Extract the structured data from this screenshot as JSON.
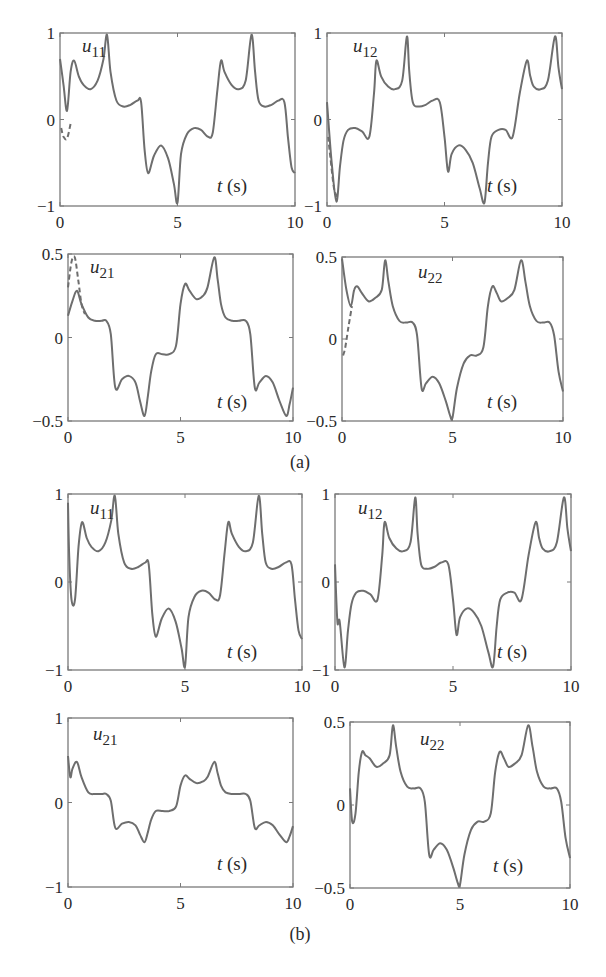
{
  "figure": {
    "captions": [
      "(a)",
      "(b)"
    ],
    "line_color": "#6e6e6e",
    "axis_color": "#7a7a7a",
    "text_color": "#2a2a2a"
  },
  "chart_data": [
    {
      "id": "a-u11",
      "panel": "(a)",
      "type": "line",
      "title": "u11",
      "label_main": "u",
      "label_sub": "11",
      "xlabel": "t (s)",
      "xlim": [
        0,
        10
      ],
      "ylim": [
        -1,
        1
      ],
      "xticks": [
        "0",
        "5",
        "10"
      ],
      "yticks": [
        "-1",
        "0",
        "1"
      ],
      "box": [
        60,
        33,
        295,
        206
      ],
      "series": [
        {
          "name": "actual",
          "style": "solid",
          "x": [
            0,
            0.15,
            0.3,
            0.45,
            0.6,
            0.8,
            1.0,
            1.3,
            1.6,
            1.85,
            2.0,
            2.15,
            2.4,
            2.7,
            3.0,
            3.3,
            3.45,
            3.6,
            3.75,
            4.0,
            4.3,
            4.6,
            4.85,
            5.0,
            5.15,
            5.4,
            5.7,
            6.0,
            6.3,
            6.5,
            6.7,
            6.85,
            7.0,
            7.3,
            7.6,
            7.9,
            8.15,
            8.3,
            8.45,
            8.7,
            9.0,
            9.3,
            9.55,
            9.7,
            9.85,
            10
          ],
          "y": [
            0.7,
            0.4,
            0.1,
            0.55,
            0.68,
            0.5,
            0.4,
            0.35,
            0.45,
            0.7,
            0.98,
            0.55,
            0.22,
            0.15,
            0.17,
            0.22,
            0.2,
            -0.35,
            -0.62,
            -0.42,
            -0.3,
            -0.45,
            -0.75,
            -0.96,
            -0.4,
            -0.17,
            -0.1,
            -0.12,
            -0.2,
            -0.15,
            0.35,
            0.68,
            0.55,
            0.4,
            0.35,
            0.45,
            0.98,
            0.55,
            0.22,
            0.15,
            0.17,
            0.22,
            0.2,
            -0.2,
            -0.55,
            -0.62
          ]
        },
        {
          "name": "reference",
          "style": "dashed",
          "x": [
            0.05,
            0.15,
            0.3,
            0.45
          ],
          "y": [
            -0.1,
            -0.2,
            -0.22,
            -0.05
          ]
        }
      ]
    },
    {
      "id": "a-u12",
      "panel": "(a)",
      "type": "line",
      "title": "u12",
      "label_main": "u",
      "label_sub": "12",
      "xlabel": "t (s)",
      "xlim": [
        0,
        10
      ],
      "ylim": [
        -1,
        1
      ],
      "xticks": [
        "0",
        "5",
        "10"
      ],
      "yticks": [
        "-1",
        "0",
        "1"
      ],
      "box": [
        327,
        33,
        562,
        206
      ],
      "series": [
        {
          "name": "actual",
          "style": "solid",
          "x": [
            0,
            0.2,
            0.4,
            0.55,
            0.7,
            0.9,
            1.2,
            1.5,
            1.8,
            2.0,
            2.1,
            2.3,
            2.6,
            2.9,
            3.2,
            3.4,
            3.5,
            3.65,
            3.9,
            4.2,
            4.5,
            4.8,
            5.0,
            5.15,
            5.3,
            5.6,
            5.9,
            6.2,
            6.5,
            6.7,
            6.85,
            7.0,
            7.3,
            7.6,
            7.9,
            8.2,
            8.5,
            8.65,
            8.8,
            9.1,
            9.4,
            9.7,
            9.85,
            10
          ],
          "y": [
            0.2,
            -0.5,
            -0.95,
            -0.55,
            -0.25,
            -0.12,
            -0.1,
            -0.14,
            -0.2,
            0.3,
            0.68,
            0.5,
            0.38,
            0.35,
            0.45,
            0.96,
            0.55,
            0.2,
            0.15,
            0.17,
            0.22,
            0.2,
            -0.2,
            -0.6,
            -0.4,
            -0.3,
            -0.35,
            -0.5,
            -0.8,
            -0.96,
            -0.5,
            -0.2,
            -0.12,
            -0.12,
            -0.2,
            0.3,
            0.68,
            0.5,
            0.38,
            0.35,
            0.45,
            0.96,
            0.6,
            0.35
          ]
        },
        {
          "name": "reference",
          "style": "dashed",
          "x": [
            0.05,
            0.15,
            0.3,
            0.45
          ],
          "y": [
            -0.2,
            -0.45,
            -0.8,
            -0.9
          ]
        }
      ]
    },
    {
      "id": "a-u21",
      "panel": "(a)",
      "type": "line",
      "title": "u21",
      "label_main": "u",
      "label_sub": "21",
      "xlabel": "t (s)",
      "xlim": [
        0,
        10
      ],
      "ylim": [
        -0.5,
        0.5
      ],
      "xticks": [
        "0",
        "5",
        "10"
      ],
      "yticks": [
        "-0.5",
        "0",
        "0.5"
      ],
      "box": [
        68,
        254,
        293,
        421
      ],
      "series": [
        {
          "name": "actual",
          "style": "solid",
          "x": [
            0,
            0.2,
            0.4,
            0.6,
            0.9,
            1.2,
            1.5,
            1.7,
            1.9,
            2.1,
            2.4,
            2.7,
            3.0,
            3.2,
            3.4,
            3.55,
            3.7,
            3.9,
            4.2,
            4.5,
            4.8,
            5.0,
            5.2,
            5.4,
            5.7,
            6.0,
            6.2,
            6.5,
            6.65,
            6.8,
            7.0,
            7.3,
            7.6,
            7.9,
            8.1,
            8.3,
            8.5,
            8.8,
            9.1,
            9.4,
            9.7,
            9.85,
            10
          ],
          "y": [
            0.13,
            0.22,
            0.28,
            0.2,
            0.12,
            0.1,
            0.1,
            0.1,
            0.02,
            -0.3,
            -0.25,
            -0.23,
            -0.27,
            -0.38,
            -0.47,
            -0.35,
            -0.2,
            -0.1,
            -0.1,
            -0.1,
            -0.05,
            0.2,
            0.32,
            0.28,
            0.23,
            0.25,
            0.3,
            0.48,
            0.35,
            0.2,
            0.12,
            0.1,
            0.1,
            0.1,
            0.02,
            -0.3,
            -0.27,
            -0.23,
            -0.27,
            -0.38,
            -0.47,
            -0.4,
            -0.3
          ]
        },
        {
          "name": "reference",
          "style": "dashed",
          "x": [
            0.0,
            0.15,
            0.3,
            0.45,
            0.6,
            0.75
          ],
          "y": [
            0.3,
            0.45,
            0.48,
            0.35,
            0.2,
            0.14
          ]
        }
      ]
    },
    {
      "id": "a-u22",
      "panel": "(a)",
      "type": "line",
      "title": "u22",
      "label_main": "u",
      "label_sub": "22",
      "xlabel": "t (s)",
      "xlim": [
        0,
        10
      ],
      "ylim": [
        -0.5,
        0.5
      ],
      "xticks": [
        "0",
        "5",
        "10"
      ],
      "yticks": [
        "-0.5",
        "0",
        "0.5"
      ],
      "box": [
        342,
        257,
        563,
        421
      ],
      "series": [
        {
          "name": "actual",
          "style": "solid",
          "x": [
            0,
            0.2,
            0.4,
            0.55,
            0.7,
            0.9,
            1.2,
            1.5,
            1.8,
            1.95,
            2.1,
            2.3,
            2.6,
            2.9,
            3.2,
            3.4,
            3.6,
            3.8,
            4.1,
            4.4,
            4.7,
            4.9,
            5.0,
            5.2,
            5.5,
            5.8,
            6.1,
            6.4,
            6.6,
            6.8,
            7.0,
            7.2,
            7.5,
            7.8,
            8.1,
            8.3,
            8.5,
            8.8,
            9.1,
            9.4,
            9.6,
            9.8,
            10
          ],
          "y": [
            0.49,
            0.3,
            0.2,
            0.3,
            0.32,
            0.28,
            0.23,
            0.25,
            0.3,
            0.48,
            0.35,
            0.2,
            0.11,
            0.1,
            0.1,
            0.02,
            -0.3,
            -0.27,
            -0.23,
            -0.27,
            -0.38,
            -0.47,
            -0.48,
            -0.3,
            -0.15,
            -0.1,
            -0.1,
            -0.05,
            0.2,
            0.32,
            0.28,
            0.23,
            0.25,
            0.3,
            0.48,
            0.35,
            0.2,
            0.11,
            0.1,
            0.1,
            0.02,
            -0.2,
            -0.32
          ]
        },
        {
          "name": "reference",
          "style": "dashed",
          "x": [
            0.05,
            0.15,
            0.3,
            0.45
          ],
          "y": [
            -0.1,
            -0.05,
            0.08,
            0.2
          ]
        }
      ]
    },
    {
      "id": "b-u11",
      "panel": "(b)",
      "type": "line",
      "title": "u11",
      "label_main": "u",
      "label_sub": "11",
      "xlabel": "t (s)",
      "xlim": [
        0,
        10
      ],
      "ylim": [
        -1,
        1
      ],
      "xticks": [
        "0",
        "5",
        "10"
      ],
      "yticks": [
        "-1",
        "0",
        "1"
      ],
      "box": [
        68,
        494,
        302,
        670
      ],
      "series": [
        {
          "name": "actual",
          "style": "solid",
          "x": [
            0,
            0.05,
            0.15,
            0.3,
            0.45,
            0.6,
            0.8,
            1.0,
            1.3,
            1.6,
            1.85,
            2.0,
            2.15,
            2.4,
            2.7,
            3.0,
            3.3,
            3.45,
            3.6,
            3.75,
            4.0,
            4.3,
            4.6,
            4.85,
            5.0,
            5.15,
            5.4,
            5.7,
            6.0,
            6.3,
            6.5,
            6.7,
            6.85,
            7.0,
            7.3,
            7.6,
            7.9,
            8.15,
            8.3,
            8.45,
            8.7,
            9.0,
            9.3,
            9.55,
            9.7,
            9.85,
            10
          ],
          "y": [
            0.9,
            0.3,
            -0.2,
            -0.2,
            0.4,
            0.68,
            0.5,
            0.4,
            0.35,
            0.45,
            0.7,
            0.98,
            0.55,
            0.22,
            0.15,
            0.17,
            0.22,
            0.2,
            -0.35,
            -0.62,
            -0.42,
            -0.3,
            -0.45,
            -0.75,
            -0.96,
            -0.4,
            -0.17,
            -0.1,
            -0.12,
            -0.2,
            -0.15,
            0.35,
            0.68,
            0.55,
            0.4,
            0.35,
            0.45,
            0.98,
            0.55,
            0.22,
            0.15,
            0.17,
            0.22,
            0.2,
            -0.2,
            -0.55,
            -0.65
          ]
        }
      ]
    },
    {
      "id": "b-u12",
      "panel": "(b)",
      "type": "line",
      "title": "u12",
      "label_main": "u",
      "label_sub": "12",
      "xlabel": "t (s)",
      "xlim": [
        0,
        10
      ],
      "ylim": [
        -1,
        1
      ],
      "xticks": [
        "0",
        "5",
        "10"
      ],
      "yticks": [
        "-1",
        "0",
        "1"
      ],
      "box": [
        335,
        494,
        571,
        670
      ],
      "series": [
        {
          "name": "actual",
          "style": "solid",
          "x": [
            0,
            0.1,
            0.2,
            0.4,
            0.55,
            0.7,
            0.9,
            1.2,
            1.5,
            1.8,
            2.0,
            2.1,
            2.3,
            2.6,
            2.9,
            3.2,
            3.4,
            3.5,
            3.65,
            3.9,
            4.2,
            4.5,
            4.8,
            5.0,
            5.15,
            5.3,
            5.6,
            5.9,
            6.2,
            6.5,
            6.7,
            6.85,
            7.0,
            7.3,
            7.6,
            7.9,
            8.2,
            8.5,
            8.65,
            8.8,
            9.1,
            9.4,
            9.7,
            9.85,
            10
          ],
          "y": [
            0.2,
            -0.45,
            -0.45,
            -0.97,
            -0.55,
            -0.25,
            -0.12,
            -0.1,
            -0.14,
            -0.2,
            0.3,
            0.68,
            0.5,
            0.38,
            0.35,
            0.45,
            0.96,
            0.55,
            0.2,
            0.15,
            0.17,
            0.22,
            0.2,
            -0.2,
            -0.6,
            -0.4,
            -0.3,
            -0.35,
            -0.5,
            -0.8,
            -0.96,
            -0.5,
            -0.2,
            -0.12,
            -0.12,
            -0.2,
            0.3,
            0.68,
            0.5,
            0.38,
            0.35,
            0.45,
            0.96,
            0.6,
            0.35
          ]
        }
      ]
    },
    {
      "id": "b-u21",
      "panel": "(b)",
      "type": "line",
      "title": "u21",
      "label_main": "u",
      "label_sub": "21",
      "xlabel": "t (s)",
      "xlim": [
        0,
        10
      ],
      "ylim": [
        -1,
        1
      ],
      "xticks": [
        "0",
        "5",
        "10"
      ],
      "yticks": [
        "-1",
        "0",
        "1"
      ],
      "box": [
        68,
        718,
        293,
        887
      ],
      "series": [
        {
          "name": "actual",
          "style": "solid",
          "x": [
            0,
            0.1,
            0.2,
            0.4,
            0.6,
            0.9,
            1.2,
            1.5,
            1.7,
            1.9,
            2.1,
            2.4,
            2.7,
            3.0,
            3.2,
            3.4,
            3.55,
            3.7,
            3.9,
            4.2,
            4.5,
            4.8,
            5.0,
            5.2,
            5.4,
            5.7,
            6.0,
            6.2,
            6.5,
            6.65,
            6.8,
            7.0,
            7.3,
            7.6,
            7.9,
            8.1,
            8.3,
            8.5,
            8.8,
            9.1,
            9.4,
            9.7,
            9.85,
            10
          ],
          "y": [
            0.55,
            0.3,
            0.4,
            0.48,
            0.3,
            0.12,
            0.1,
            0.1,
            0.1,
            0.02,
            -0.3,
            -0.25,
            -0.23,
            -0.27,
            -0.38,
            -0.47,
            -0.35,
            -0.2,
            -0.1,
            -0.1,
            -0.1,
            -0.05,
            0.2,
            0.32,
            0.28,
            0.23,
            0.25,
            0.3,
            0.48,
            0.35,
            0.2,
            0.12,
            0.1,
            0.1,
            0.1,
            0.02,
            -0.3,
            -0.27,
            -0.23,
            -0.27,
            -0.38,
            -0.47,
            -0.4,
            -0.28
          ]
        }
      ]
    },
    {
      "id": "b-u22",
      "panel": "(b)",
      "type": "line",
      "title": "u22",
      "label_main": "u",
      "label_sub": "22",
      "xlabel": "t (s)",
      "xlim": [
        0,
        10
      ],
      "ylim": [
        -0.5,
        0.5
      ],
      "xticks": [
        "0",
        "5",
        "10"
      ],
      "yticks": [
        "-0.5",
        "0",
        "0.5"
      ],
      "box": [
        350,
        722,
        570,
        888
      ],
      "series": [
        {
          "name": "actual",
          "style": "solid",
          "x": [
            0,
            0.1,
            0.25,
            0.4,
            0.55,
            0.7,
            0.9,
            1.2,
            1.5,
            1.8,
            1.95,
            2.1,
            2.3,
            2.6,
            2.9,
            3.2,
            3.4,
            3.6,
            3.8,
            4.1,
            4.4,
            4.7,
            4.9,
            5.0,
            5.2,
            5.5,
            5.8,
            6.1,
            6.4,
            6.6,
            6.8,
            7.0,
            7.2,
            7.5,
            7.8,
            8.1,
            8.3,
            8.5,
            8.8,
            9.1,
            9.4,
            9.6,
            9.8,
            10
          ],
          "y": [
            0.1,
            -0.1,
            -0.05,
            0.2,
            0.32,
            0.3,
            0.28,
            0.23,
            0.25,
            0.3,
            0.48,
            0.35,
            0.2,
            0.11,
            0.1,
            0.1,
            0.02,
            -0.3,
            -0.27,
            -0.23,
            -0.27,
            -0.38,
            -0.47,
            -0.48,
            -0.3,
            -0.15,
            -0.1,
            -0.1,
            -0.05,
            0.2,
            0.32,
            0.28,
            0.23,
            0.25,
            0.3,
            0.48,
            0.35,
            0.2,
            0.11,
            0.1,
            0.1,
            0.02,
            -0.2,
            -0.32
          ]
        }
      ]
    }
  ],
  "layout": {
    "ylabel_pos": [
      [
        82,
        52
      ],
      [
        353,
        52
      ],
      [
        90,
        273
      ],
      [
        418,
        278
      ],
      [
        90,
        514
      ],
      [
        358,
        514
      ],
      [
        93,
        740
      ],
      [
        420,
        745
      ]
    ],
    "xlabel_pos": [
      [
        232,
        192
      ],
      [
        502,
        192
      ],
      [
        232,
        408
      ],
      [
        502,
        408
      ],
      [
        242,
        658
      ],
      [
        512,
        658
      ],
      [
        232,
        870
      ],
      [
        508,
        872
      ]
    ],
    "caption_pos": [
      [
        300,
        468
      ],
      [
        300,
        940
      ]
    ]
  }
}
